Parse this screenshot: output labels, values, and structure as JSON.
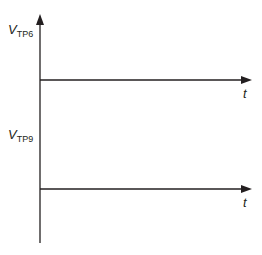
{
  "diagram": {
    "type": "timing-axes",
    "colors": {
      "line": "#231f20",
      "background": "#ffffff"
    },
    "vertical_axis": {
      "x": 40,
      "top": 14,
      "bottom": 243
    },
    "plots": [
      {
        "label_main": "V",
        "label_sub": "TP6",
        "time_label": "t",
        "baseline_y": 80,
        "axis_end_x": 251
      },
      {
        "label_main": "V",
        "label_sub": "TP9",
        "time_label": "t",
        "baseline_y": 189,
        "axis_end_x": 251
      }
    ]
  }
}
